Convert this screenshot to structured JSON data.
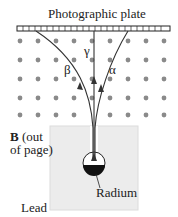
{
  "title": "Photographic plate",
  "labels": {
    "beta": "β",
    "gamma": "γ",
    "alpha": "α",
    "field_bold": "B",
    "field_rest1": " (out",
    "field_rest2": "of page)",
    "radium": "Radium",
    "lead": "Lead"
  },
  "colors": {
    "dot": "#8a8a8a",
    "lead": "#ececec",
    "line": "#333333"
  }
}
